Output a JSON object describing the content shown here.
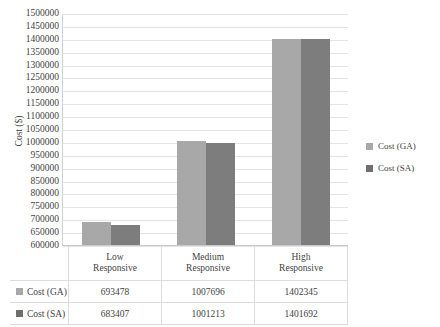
{
  "chart_data": {
    "type": "bar",
    "title": "",
    "xlabel": "",
    "ylabel": "Cost ($)",
    "categories": [
      "Low Responsive",
      "Medium Responsive",
      "High Responsive"
    ],
    "category_lines": [
      [
        "Low",
        "Responsive"
      ],
      [
        "Medium",
        "Responsive"
      ],
      [
        "High",
        "Responsive"
      ]
    ],
    "series": [
      {
        "name": "Cost (GA)",
        "color": "#a8a8a8",
        "values": [
          693478,
          1007696,
          1402345
        ]
      },
      {
        "name": "Cost (SA)",
        "color": "#7d7d7d",
        "values": [
          683407,
          1001213,
          1401692
        ]
      }
    ],
    "ylim": [
      600000,
      1500000
    ],
    "ytick_step": 50000,
    "yticks": [
      1500000,
      1450000,
      1400000,
      1350000,
      1300000,
      1250000,
      1200000,
      1150000,
      1100000,
      1050000,
      1000000,
      950000,
      900000,
      850000,
      800000,
      750000,
      700000,
      650000,
      600000
    ],
    "grid": true,
    "legend_position": "right"
  },
  "legend": {
    "items": [
      {
        "label": "Cost (GA)",
        "marker": "legend-swatch-ga"
      },
      {
        "label": "Cost (SA)",
        "marker": "legend-swatch-sa"
      }
    ]
  },
  "table": {
    "corner": "",
    "column_headers": [
      {
        "line1": "Low",
        "line2": "Responsive"
      },
      {
        "line1": "Medium",
        "line2": "Responsive"
      },
      {
        "line1": "High",
        "line2": "Responsive"
      }
    ],
    "rows": [
      {
        "key": "Cost (GA)",
        "marker": "table-swatch-ga",
        "values": [
          "693478",
          "1007696",
          "1402345"
        ]
      },
      {
        "key": "Cost (SA)",
        "marker": "table-swatch-sa",
        "values": [
          "683407",
          "1001213",
          "1401692"
        ]
      }
    ]
  }
}
